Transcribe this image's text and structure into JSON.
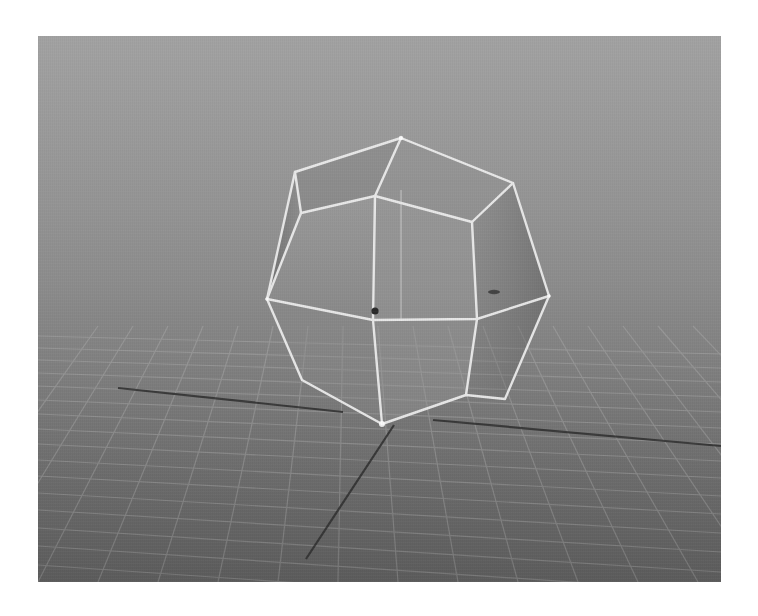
{
  "viewport": {
    "kind": "3d-perspective-viewport",
    "background": {
      "top_color": "#a2a2a2",
      "bottom_color": "#5c5c5c"
    },
    "grid": {
      "line_color": "#a8a8a8",
      "visible": true
    },
    "axes": {
      "x_axis_color": "#2e2e2e",
      "z_axis_color": "#2e2e2e"
    },
    "object": {
      "type": "polyhedron-wireframe",
      "wire_color": "#eeeeee",
      "selected": true,
      "pivot_markers": 2
    }
  }
}
